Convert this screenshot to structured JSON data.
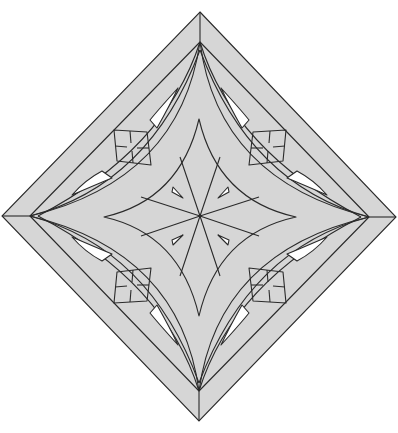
{
  "diagram": {
    "colors": {
      "fill": "#d6d6d6",
      "stroke": "#2a2a2a",
      "background": "#ffffff",
      "cutout": "#ffffff"
    },
    "outer_diamond": [
      [
        200,
        12
      ],
      [
        396,
        217
      ],
      [
        199,
        421
      ],
      [
        2,
        216
      ]
    ],
    "inner_diamond": [
      [
        200,
        42
      ],
      [
        369,
        217
      ],
      [
        199,
        391
      ],
      [
        30,
        216
      ]
    ],
    "center": [
      200,
      216
    ],
    "star_tips": [
      [
        199,
        119
      ],
      [
        296,
        217
      ],
      [
        199,
        316
      ],
      [
        104,
        217
      ]
    ],
    "motifs": {
      "small_squares_with_cross": 4,
      "white_crescent_cutouts": 8,
      "small_white_triangles": 4,
      "radial_lines": 8
    }
  }
}
